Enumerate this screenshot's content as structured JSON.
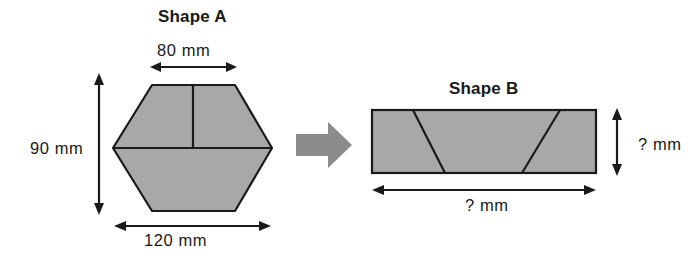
{
  "diagram": {
    "title_a": "Shape A",
    "title_b": "Shape B",
    "shape_a": {
      "name": "hexagon",
      "top_width_label": "80 mm",
      "height_label": "90 mm",
      "bottom_width_label": "120 mm",
      "fill_color": "#a8a8a8",
      "stroke_color": "#1a1a1a"
    },
    "shape_b": {
      "name": "rectangle",
      "height_label": "? mm",
      "width_label": "? mm",
      "fill_color": "#a8a8a8",
      "stroke_color": "#1a1a1a"
    },
    "transform_arrow": {
      "name": "right-arrow",
      "color": "#8c8c8c"
    }
  }
}
